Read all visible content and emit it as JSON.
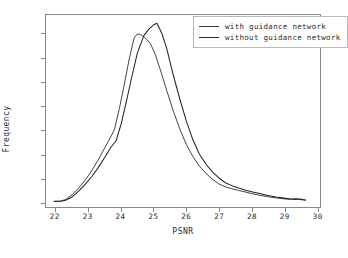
{
  "chart_data": {
    "type": "line",
    "title": "",
    "xlabel": "PSNR",
    "ylabel": "Frequency",
    "xlim": [
      21.7,
      30.1
    ],
    "ylim": [
      -0.004,
      0.156
    ],
    "xticks": [
      "22",
      "23",
      "24",
      "25",
      "26",
      "27",
      "28",
      "29",
      "30"
    ],
    "xtick_values": [
      22,
      23,
      24,
      25,
      26,
      27,
      28,
      29,
      30
    ],
    "yticks": [
      "0.00",
      "0.02",
      "0.04",
      "0.06",
      "0.08",
      "0.10",
      "0.12",
      "0.14"
    ],
    "ytick_values": [
      0.0,
      0.02,
      0.04,
      0.06,
      0.08,
      0.1,
      0.12,
      0.14
    ],
    "grid": false,
    "legend_position": "upper right",
    "series": [
      {
        "name": "with guidance network",
        "color": "#3a3a3a",
        "x": [
          21.95,
          22.15,
          22.3,
          22.5,
          22.7,
          22.9,
          23.1,
          23.3,
          23.5,
          23.7,
          23.8,
          23.95,
          24.1,
          24.25,
          24.4,
          24.5,
          24.6,
          24.75,
          24.9,
          25.05,
          25.2,
          25.4,
          25.6,
          25.8,
          26.0,
          26.2,
          26.4,
          26.6,
          26.8,
          27.0,
          27.2,
          27.4,
          27.6,
          27.8,
          28.0,
          28.25,
          28.5,
          28.75,
          29.0,
          29.2,
          29.35,
          29.5,
          29.65
        ],
        "y": [
          0.0008,
          0.001,
          0.0022,
          0.0062,
          0.0118,
          0.0182,
          0.0262,
          0.0352,
          0.0452,
          0.0552,
          0.0608,
          0.0782,
          0.0982,
          0.1192,
          0.1368,
          0.1402,
          0.1398,
          0.1368,
          0.1322,
          0.1232,
          0.1108,
          0.0932,
          0.0762,
          0.0612,
          0.0482,
          0.0382,
          0.0302,
          0.0242,
          0.0192,
          0.0152,
          0.0128,
          0.0112,
          0.0098,
          0.0086,
          0.0072,
          0.0058,
          0.0046,
          0.0036,
          0.0028,
          0.0024,
          0.0032,
          0.0022,
          0.0016
        ]
      },
      {
        "name": "without guidance network",
        "color": "#262626",
        "x": [
          21.95,
          22.15,
          22.3,
          22.5,
          22.7,
          22.9,
          23.1,
          23.3,
          23.5,
          23.7,
          23.85,
          24.0,
          24.15,
          24.3,
          24.5,
          24.7,
          24.85,
          25.0,
          25.1,
          25.25,
          25.4,
          25.6,
          25.8,
          26.0,
          26.2,
          26.4,
          26.6,
          26.8,
          27.0,
          27.2,
          27.4,
          27.6,
          27.8,
          28.0,
          28.25,
          28.5,
          28.75,
          29.0,
          29.2,
          29.35,
          29.5,
          29.65
        ],
        "y": [
          0.0006,
          0.0008,
          0.0016,
          0.0044,
          0.0092,
          0.0148,
          0.0212,
          0.0288,
          0.0372,
          0.0462,
          0.0512,
          0.0648,
          0.0822,
          0.1008,
          0.1242,
          0.1388,
          0.1442,
          0.1478,
          0.1492,
          0.1408,
          0.1282,
          0.1062,
          0.0862,
          0.0678,
          0.0522,
          0.0402,
          0.0318,
          0.0252,
          0.0202,
          0.0162,
          0.0138,
          0.0118,
          0.0102,
          0.0088,
          0.0072,
          0.0056,
          0.0044,
          0.0034,
          0.0026,
          0.0022,
          0.0026,
          0.0018
        ]
      }
    ]
  },
  "legend": {
    "items": [
      {
        "label": "with guidance network"
      },
      {
        "label": "without guidance network"
      }
    ]
  }
}
